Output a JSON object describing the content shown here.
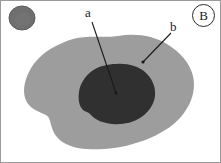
{
  "figure": {
    "panel_letter": "B",
    "background_color": "#ffffff",
    "frame_color": "#9a9a9a",
    "width": 221,
    "height": 163
  },
  "labels": {
    "a": {
      "text": "a",
      "description": "leader label pointing to dark inner region",
      "leader_start": [
        92,
        22
      ],
      "leader_end": [
        116,
        93
      ]
    },
    "b": {
      "text": "b",
      "description": "leader label pointing to light gray outer region",
      "leader_start": [
        171,
        33
      ],
      "leader_end": [
        143,
        62
      ]
    }
  },
  "shapes": {
    "outer_blob": {
      "name": "outer-region",
      "fill": "#9d9d9d",
      "label_ref": "b"
    },
    "inner_blob": {
      "name": "inner-region",
      "fill": "#303030",
      "label_ref": "a"
    },
    "corner_circle": {
      "name": "reference-circle",
      "fill": "#6f6f6f",
      "stroke": "#5b5b5b",
      "cx": 22,
      "cy": 18,
      "rx": 13,
      "ry": 12
    }
  },
  "leader_line_color": "#1a1a1a"
}
